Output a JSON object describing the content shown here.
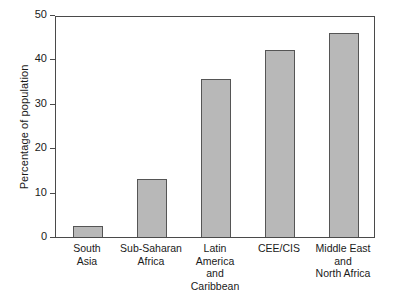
{
  "chart_data": {
    "type": "bar",
    "title": "",
    "subtitle": "",
    "xlabel": "",
    "ylabel": "Percentage of population",
    "categories": [
      "South\nAsia",
      "Sub-Saharan\nAfrica",
      "Latin\nAmerica\nand\nCaribbean",
      "CEE/CIS",
      "Middle East\nand\nNorth Africa"
    ],
    "values": [
      2.5,
      13,
      35.5,
      42.2,
      46
    ],
    "ylim": [
      0,
      50
    ],
    "yticks": [
      0,
      10,
      20,
      30,
      40,
      50
    ],
    "ytick_labels": [
      "0",
      "10",
      "20",
      "30",
      "40",
      "50"
    ],
    "grid": false,
    "legend": null,
    "bar_color": "#b8b8b8",
    "bar_edge_color": "#555555",
    "axis_color": "#4a4a4a",
    "text_color": "#1a1a1a",
    "background": "#ffffff"
  }
}
